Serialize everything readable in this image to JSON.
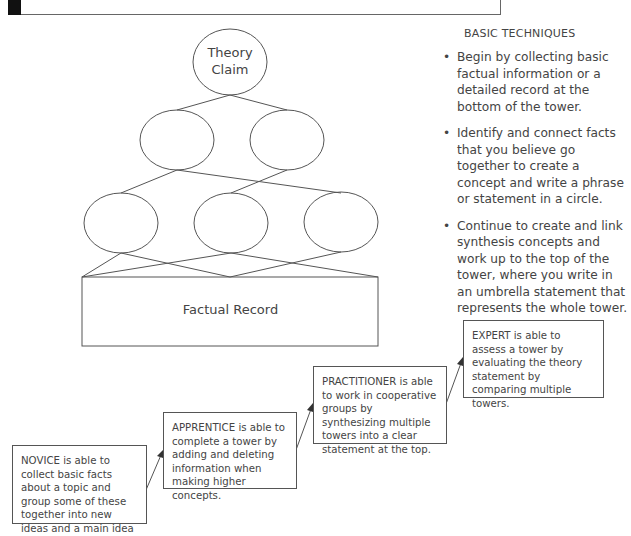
{
  "diagram": {
    "type": "knowledge-tower",
    "top_node": {
      "label_line1": "Theory",
      "label_line2": "Claim"
    },
    "level2_nodes": 2,
    "level3_nodes": 3,
    "base": {
      "label": "Factual Record"
    },
    "line_color": "#555555"
  },
  "techniques": {
    "title": "BASIC TECHNIQUES",
    "bullet": "•",
    "items": [
      {
        "text": "Begin by collecting basic factual information or a detailed record at the bottom of the tower."
      },
      {
        "text": "Identify and connect facts that you believe go together to create a concept and write a phrase or statement in a circle."
      },
      {
        "text": "Continue to create and link synthesis concepts and work up to the top of the tower, where you write in an umbrella statement that represents the whole tower."
      }
    ]
  },
  "levels": [
    {
      "name": "novice",
      "text": "NOVICE is able to collect basic facts about a topic and group some of these together into new ideas and a main idea at the top."
    },
    {
      "name": "apprentice",
      "text": "APPRENTICE is able to complete a tower by adding and deleting information when making higher concepts."
    },
    {
      "name": "practitioner",
      "text": "PRACTITIONER is able to work in cooperative groups by synthesizing multiple towers into a clear statement at the top."
    },
    {
      "name": "expert",
      "text": "EXPERT is able to assess a tower by evaluating the theory statement by comparing multiple towers."
    }
  ]
}
